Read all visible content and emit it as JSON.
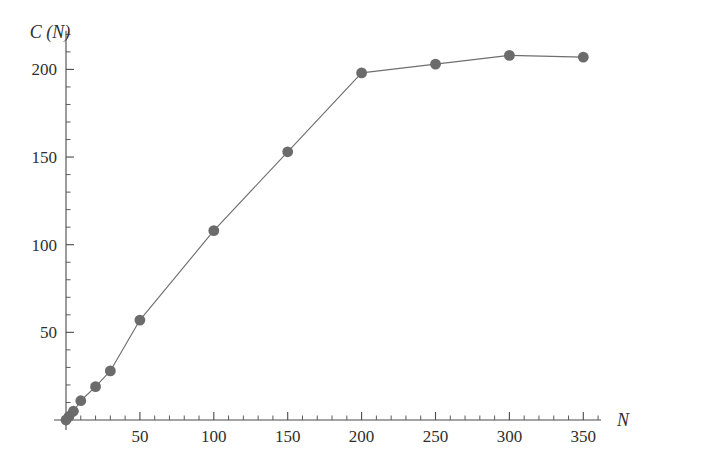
{
  "chart_data": {
    "type": "line",
    "title": "",
    "subtitle": "",
    "xlabel": "N",
    "ylabel": "C (N)",
    "xlim": [
      0,
      362
    ],
    "ylim": [
      0,
      222
    ],
    "grid": false,
    "legend": "none",
    "markers": "filled-circle",
    "marker_color": "#6b6b6b",
    "line_color": "#6f6f6f",
    "axis_color": "#4a4a4a",
    "x_ticks_major": [
      50,
      100,
      150,
      200,
      250,
      300,
      350
    ],
    "x_tick_labels": [
      "50",
      "100",
      "150",
      "200",
      "250",
      "300",
      "350"
    ],
    "x_tick_minor_step": 10,
    "y_ticks_major": [
      50,
      100,
      150,
      200
    ],
    "y_tick_labels": [
      "50",
      "100",
      "150",
      "200"
    ],
    "y_tick_minor_step": 10,
    "x": [
      0,
      2,
      5,
      10,
      20,
      30,
      50,
      100,
      150,
      200,
      250,
      300,
      350
    ],
    "values": [
      0,
      2,
      5,
      11,
      19,
      28,
      57,
      108,
      153,
      198,
      203,
      208,
      207
    ],
    "series": [
      {
        "name": "C(N)",
        "points": [
          {
            "x": 0,
            "y": 0
          },
          {
            "x": 2,
            "y": 2
          },
          {
            "x": 5,
            "y": 5
          },
          {
            "x": 10,
            "y": 11
          },
          {
            "x": 20,
            "y": 19
          },
          {
            "x": 30,
            "y": 28
          },
          {
            "x": 50,
            "y": 57
          },
          {
            "x": 100,
            "y": 108
          },
          {
            "x": 150,
            "y": 153
          },
          {
            "x": 200,
            "y": 198
          },
          {
            "x": 250,
            "y": 203
          },
          {
            "x": 300,
            "y": 208
          },
          {
            "x": 350,
            "y": 207
          }
        ]
      }
    ]
  },
  "axes": {
    "y_title": "C (N)",
    "x_title": "N"
  }
}
